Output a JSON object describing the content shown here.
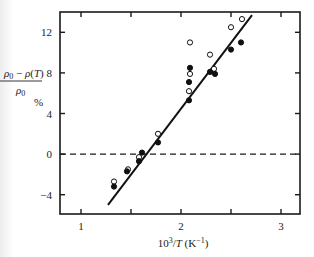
{
  "chart_data": {
    "type": "scatter",
    "title": "",
    "xlabel": "10^3/T (K^-1)",
    "ylabel_numerator": "ρ0 − ρ(T)",
    "ylabel_denominator": "ρ0",
    "ylabel_unit": "%",
    "xlim": [
      0.79,
      3.19
    ],
    "ylim": [
      -5.9,
      14.0
    ],
    "x_ticks": [
      1,
      2,
      3
    ],
    "x_minor_ticks": [
      1.5,
      2.5
    ],
    "y_ticks": [
      -4,
      0,
      4,
      8,
      12
    ],
    "y_tick_labels": [
      "−4",
      "0",
      "4",
      "8",
      "12"
    ],
    "x_tick_labels": [
      "1",
      "2",
      "3"
    ],
    "grid": false,
    "reference_line": {
      "y": 0,
      "style": "dashed"
    },
    "fit_line": {
      "x": [
        1.27,
        2.71
      ],
      "y": [
        -5.0,
        13.7
      ],
      "style": "solid"
    },
    "series": [
      {
        "name": "open circles",
        "marker": "open-circle",
        "points": [
          [
            1.33,
            -2.7
          ],
          [
            1.47,
            -1.5
          ],
          [
            1.58,
            -0.3
          ],
          [
            1.77,
            2.0
          ],
          [
            2.08,
            6.2
          ],
          [
            2.09,
            7.9
          ],
          [
            2.09,
            11.0
          ],
          [
            2.29,
            9.8
          ],
          [
            2.33,
            8.4
          ],
          [
            2.5,
            12.5
          ],
          [
            2.61,
            13.3
          ]
        ]
      },
      {
        "name": "filled circles",
        "marker": "filled-circle",
        "points": [
          [
            1.33,
            -3.2
          ],
          [
            1.46,
            -1.7
          ],
          [
            1.58,
            -0.7
          ],
          [
            1.61,
            0.15
          ],
          [
            1.77,
            1.15
          ],
          [
            2.08,
            5.3
          ],
          [
            2.08,
            7.1
          ],
          [
            2.09,
            8.5
          ],
          [
            2.29,
            8.1
          ],
          [
            2.34,
            7.9
          ],
          [
            2.5,
            10.3
          ],
          [
            2.6,
            11.0
          ]
        ]
      }
    ]
  }
}
